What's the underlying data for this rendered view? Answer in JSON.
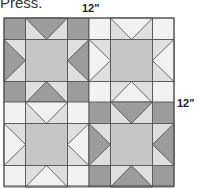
{
  "caption_fragment": "Press.",
  "dimensions": {
    "width_label": "12\"",
    "height_label": "12\""
  },
  "diagram": {
    "type": "quilt-layout",
    "layout": "2x2 Sawtooth Star blocks",
    "blocks": [
      {
        "position": "top-left",
        "scheme": "dark"
      },
      {
        "position": "top-right",
        "scheme": "light"
      },
      {
        "position": "bottom-left",
        "scheme": "light"
      },
      {
        "position": "bottom-right",
        "scheme": "dark"
      }
    ],
    "colors": {
      "dark": "#9c9c9c",
      "center": "#c6c6c6",
      "side": "#dedede",
      "light": "#f2f2f2",
      "line": "#4a4a4a"
    }
  }
}
